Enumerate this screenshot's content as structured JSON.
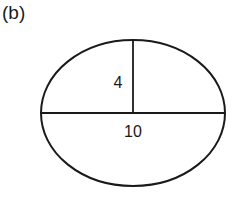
{
  "panel_label": "(b)",
  "diagram": {
    "shape": "ellipse",
    "major_axis_label": "10",
    "semi_minor_axis_label": "4",
    "stroke_color": "#1a1a1a",
    "background": "#ffffff"
  }
}
